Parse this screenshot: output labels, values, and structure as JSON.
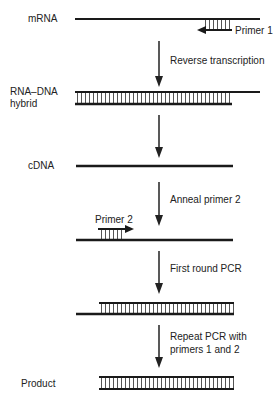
{
  "diagram": {
    "colors": {
      "strand": "#1a1a1a",
      "hatch": "#555555",
      "arrow": "#222222",
      "text": "#222222",
      "background": "#ffffff"
    },
    "stages": [
      {
        "id": "mrna",
        "label": "mRNA"
      },
      {
        "id": "hybrid",
        "label_line1": "RNA–DNA",
        "label_line2": "hybrid"
      },
      {
        "id": "cdna",
        "label": "cDNA"
      },
      {
        "id": "anneal",
        "label": ""
      },
      {
        "id": "first-round",
        "label": ""
      },
      {
        "id": "product",
        "label": "Product"
      }
    ],
    "primers": {
      "primer1": "Primer 1",
      "primer2": "Primer 2"
    },
    "steps": [
      {
        "id": "reverse-transcription",
        "line1": "Reverse transcription"
      },
      {
        "id": "anneal-primer-2",
        "line1": "Anneal primer 2"
      },
      {
        "id": "first-round-pcr",
        "line1": "First round PCR"
      },
      {
        "id": "repeat-pcr",
        "line1": "Repeat PCR with",
        "line2": "primers 1 and 2"
      }
    ]
  }
}
